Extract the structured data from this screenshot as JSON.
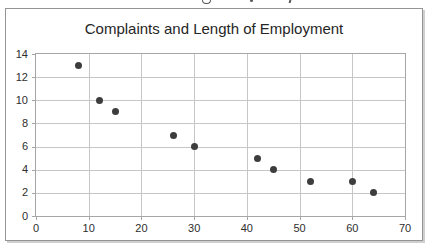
{
  "figure": {
    "background": "#ffffff",
    "border_color": "#949494",
    "shadow_color": "#cfcfcf"
  },
  "chart_data": {
    "type": "scatter",
    "title": "Complaints and Length of Employment",
    "xlabel": "",
    "ylabel": "",
    "x": [
      8,
      12,
      15,
      26,
      30,
      42,
      45,
      52,
      60,
      64
    ],
    "y": [
      13,
      10,
      9,
      7,
      6,
      5,
      4,
      3,
      3,
      2
    ],
    "xlim": [
      0,
      70
    ],
    "ylim": [
      0,
      14
    ],
    "x_ticks": [
      0,
      10,
      20,
      30,
      40,
      50,
      60,
      70
    ],
    "y_ticks": [
      0,
      2,
      4,
      6,
      8,
      10,
      12,
      14
    ],
    "grid": true,
    "legend": false,
    "colors": {
      "point": "#3d3d3d",
      "grid": "#c6c6c6",
      "frame": "#a6a6a6",
      "tick_label": "#2e2e2e",
      "title": "#262626"
    }
  }
}
